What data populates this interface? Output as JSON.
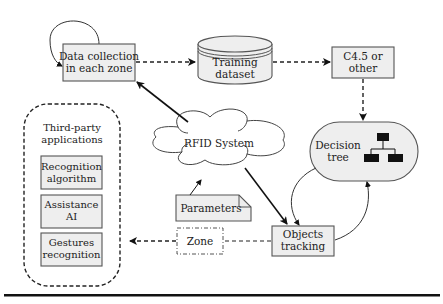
{
  "diagram": {
    "nodes": {
      "data_collection": {
        "line1": "Data collection",
        "line2": "in each zone"
      },
      "training_dataset": {
        "line1": "Training",
        "line2": "dataset"
      },
      "c45": {
        "line1": "C4.5 or",
        "line2": "other"
      },
      "decision_tree": {
        "line1": "Decision",
        "line2": "tree"
      },
      "rfid_system": {
        "label": "RFID System"
      },
      "parameters": {
        "label": "Parameters"
      },
      "zone": {
        "label": "Zone"
      },
      "objects_tracking": {
        "line1": "Objects",
        "line2": "tracking"
      },
      "third_party": {
        "title1": "Third-party",
        "title2": "applications",
        "apps": [
          {
            "line1": "Recognition",
            "line2": "algorithm"
          },
          {
            "line1": "Assistance",
            "line2": "AI"
          },
          {
            "line1": "Gestures",
            "line2": "recognition"
          }
        ]
      }
    },
    "colors": {
      "box_fill": "#eeeeee",
      "stroke": "#555555",
      "text": "#222222"
    }
  }
}
